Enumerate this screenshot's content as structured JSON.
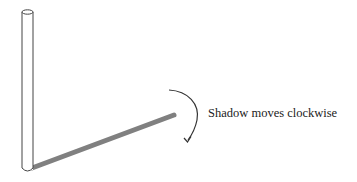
{
  "diagram": {
    "annotation": "Shadow moves clockwise",
    "colors": {
      "pole_stroke": "#444444",
      "shadow": "#808080",
      "arrow": "#333333",
      "background": "#ffffff"
    }
  }
}
